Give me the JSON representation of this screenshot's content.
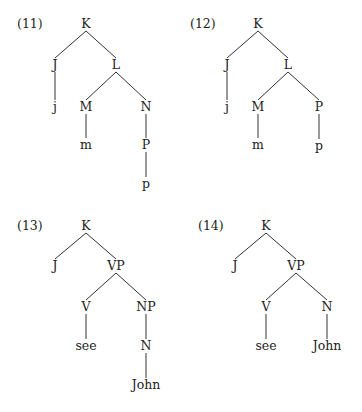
{
  "trees": [
    {
      "label": "(11)",
      "label_pos": [
        17,
        24
      ],
      "nodes": [
        {
          "id": "K",
          "text": "K",
          "x": 86,
          "y": 24
        },
        {
          "id": "J",
          "text": "J",
          "x": 55,
          "y": 65
        },
        {
          "id": "L",
          "text": "L",
          "x": 116,
          "y": 65
        },
        {
          "id": "j",
          "text": "j",
          "x": 55,
          "y": 107
        },
        {
          "id": "M",
          "text": "M",
          "x": 86,
          "y": 107
        },
        {
          "id": "N",
          "text": "N",
          "x": 146,
          "y": 107
        },
        {
          "id": "m",
          "text": "m",
          "x": 86,
          "y": 145
        },
        {
          "id": "P",
          "text": "P",
          "x": 146,
          "y": 145
        },
        {
          "id": "p",
          "text": "p",
          "x": 146,
          "y": 184
        }
      ],
      "edges": [
        [
          "K",
          "J"
        ],
        [
          "K",
          "L"
        ],
        [
          "J",
          "j"
        ],
        [
          "L",
          "M"
        ],
        [
          "L",
          "N"
        ],
        [
          "M",
          "m"
        ],
        [
          "N",
          "P"
        ],
        [
          "P",
          "p"
        ]
      ]
    },
    {
      "label": "(12)",
      "label_pos": [
        190,
        24
      ],
      "nodes": [
        {
          "id": "K",
          "text": "K",
          "x": 258,
          "y": 24
        },
        {
          "id": "J",
          "text": "J",
          "x": 227,
          "y": 65
        },
        {
          "id": "L",
          "text": "L",
          "x": 288,
          "y": 65
        },
        {
          "id": "j",
          "text": "j",
          "x": 227,
          "y": 107
        },
        {
          "id": "M",
          "text": "M",
          "x": 258,
          "y": 107
        },
        {
          "id": "P",
          "text": "P",
          "x": 319,
          "y": 107
        },
        {
          "id": "m",
          "text": "m",
          "x": 258,
          "y": 145
        },
        {
          "id": "p",
          "text": "p",
          "x": 319,
          "y": 146
        }
      ],
      "edges": [
        [
          "K",
          "J"
        ],
        [
          "K",
          "L"
        ],
        [
          "J",
          "j"
        ],
        [
          "L",
          "M"
        ],
        [
          "L",
          "P"
        ],
        [
          "M",
          "m"
        ],
        [
          "P",
          "p"
        ]
      ]
    },
    {
      "label": "(13)",
      "label_pos": [
        17,
        226
      ],
      "nodes": [
        {
          "id": "K",
          "text": "K",
          "x": 86,
          "y": 226
        },
        {
          "id": "J",
          "text": "J",
          "x": 55,
          "y": 266
        },
        {
          "id": "VP",
          "text": "VP",
          "x": 116,
          "y": 266
        },
        {
          "id": "V",
          "text": "V",
          "x": 86,
          "y": 307
        },
        {
          "id": "NP",
          "text": "NP",
          "x": 146,
          "y": 307
        },
        {
          "id": "see",
          "text": "see",
          "x": 86,
          "y": 346
        },
        {
          "id": "N",
          "text": "N",
          "x": 146,
          "y": 346
        },
        {
          "id": "John",
          "text": "John",
          "x": 146,
          "y": 385
        }
      ],
      "edges": [
        [
          "K",
          "J"
        ],
        [
          "K",
          "VP"
        ],
        [
          "VP",
          "V"
        ],
        [
          "VP",
          "NP"
        ],
        [
          "V",
          "see"
        ],
        [
          "NP",
          "N"
        ],
        [
          "N",
          "John"
        ]
      ]
    },
    {
      "label": "(14)",
      "label_pos": [
        198,
        226
      ],
      "nodes": [
        {
          "id": "K",
          "text": "K",
          "x": 266,
          "y": 226
        },
        {
          "id": "J",
          "text": "J",
          "x": 235,
          "y": 266
        },
        {
          "id": "VP",
          "text": "VP",
          "x": 296,
          "y": 266
        },
        {
          "id": "V",
          "text": "V",
          "x": 266,
          "y": 307
        },
        {
          "id": "N",
          "text": "N",
          "x": 327,
          "y": 307
        },
        {
          "id": "see",
          "text": "see",
          "x": 266,
          "y": 346
        },
        {
          "id": "John",
          "text": "John",
          "x": 327,
          "y": 346
        }
      ],
      "edges": [
        [
          "K",
          "J"
        ],
        [
          "K",
          "VP"
        ],
        [
          "VP",
          "V"
        ],
        [
          "VP",
          "N"
        ],
        [
          "V",
          "see"
        ],
        [
          "N",
          "John"
        ]
      ]
    }
  ]
}
